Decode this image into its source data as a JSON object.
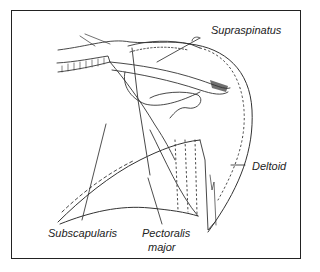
{
  "figure": {
    "labels": {
      "supraspinatus": "Supraspinatus",
      "deltoid": "Deltoid",
      "subscapularis": "Subscapularis",
      "pectoralis_line1": "Pectoralis",
      "pectoralis_line2": "major"
    }
  }
}
